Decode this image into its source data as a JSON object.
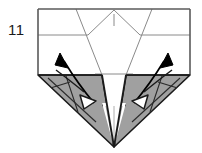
{
  "figure": {
    "step_number": "11",
    "caption": "",
    "type": "origami-fold-diagram"
  },
  "colors": {
    "paper_front": "#ffffff",
    "paper_back_shaded": "#a0a0a0",
    "paper_back_shaded_dark": "#8f8f8f",
    "outline": "#1a1a1a",
    "crease_line": "#8a8a8a",
    "valley_crease": "#2b2b2b",
    "arrow_solid": "#000000",
    "arrow_hollow_fill": "#ffffff",
    "background": "#ffffff"
  },
  "geometry": {
    "sheet_rect": {
      "x": 38,
      "y": 9,
      "width": 152,
      "height": 66
    },
    "bottom_apex": {
      "x": 114,
      "y": 147
    },
    "left_corner": {
      "x": 38,
      "y": 75
    },
    "right_corner": {
      "x": 190,
      "y": 75
    },
    "top_peak": {
      "x": 114,
      "y": 9
    },
    "horizontal_crease_upper_y": 35,
    "horizontal_crease_lower_y": 74
  },
  "annotations": {
    "arrows": [
      {
        "name": "left-unfold-arrow",
        "style": "solid-head",
        "direction": "up-left",
        "from": {
          "x": 94,
          "y": 103
        },
        "to": {
          "x": 62,
          "y": 58
        }
      },
      {
        "name": "left-fold-arrow",
        "style": "hollow-head",
        "direction": "down-right",
        "from": {
          "x": 56,
          "y": 70
        },
        "to": {
          "x": 90,
          "y": 99
        }
      },
      {
        "name": "right-unfold-arrow",
        "style": "solid-head",
        "direction": "up-right",
        "from": {
          "x": 134,
          "y": 103
        },
        "to": {
          "x": 166,
          "y": 58
        }
      },
      {
        "name": "right-fold-arrow",
        "style": "hollow-head",
        "direction": "down-left",
        "from": {
          "x": 172,
          "y": 70
        },
        "to": {
          "x": 138,
          "y": 99
        }
      }
    ],
    "tick_marks": [
      {
        "name": "top-center-tick",
        "x": 114,
        "y1": 14,
        "y2": 26
      }
    ]
  }
}
